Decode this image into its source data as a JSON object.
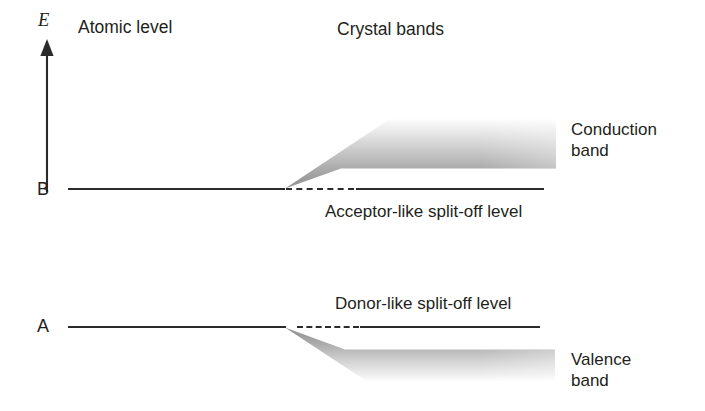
{
  "diagram": {
    "title_axis": "E",
    "headers": {
      "left": "Atomic level",
      "right": "Crystal bands"
    },
    "levels": [
      {
        "id": "B",
        "label": "B"
      },
      {
        "id": "A",
        "label": "A"
      }
    ],
    "captions": {
      "acceptor": "Acceptor-like split-off level",
      "donor": "Donor-like split-off level"
    },
    "bands": {
      "conduction_line1": "Conduction",
      "conduction_line2": "band",
      "valence_line1": "Valence",
      "valence_line2": "band"
    },
    "colors": {
      "ink": "#231f20",
      "line": "#2b2b2b",
      "band_dark": "#9a9a9a",
      "band_light": "#ffffff",
      "background": "#ffffff"
    }
  }
}
